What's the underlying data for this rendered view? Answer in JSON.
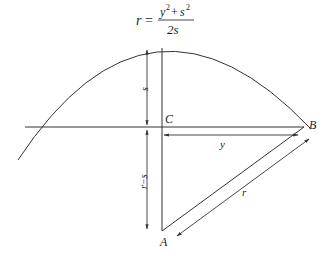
{
  "formula": {
    "lhs": "r",
    "equals": "=",
    "numerator_y": "y",
    "numerator_plus": "+",
    "numerator_s": "s",
    "exp": "2",
    "denominator": "2s"
  },
  "labels": {
    "C": "C",
    "B": "B",
    "A": "A",
    "s": "s",
    "r_minus_s": "r−s",
    "y": "y",
    "r": "r"
  },
  "colors": {
    "stroke": "#333333",
    "text": "#222222",
    "background": "#ffffff"
  }
}
